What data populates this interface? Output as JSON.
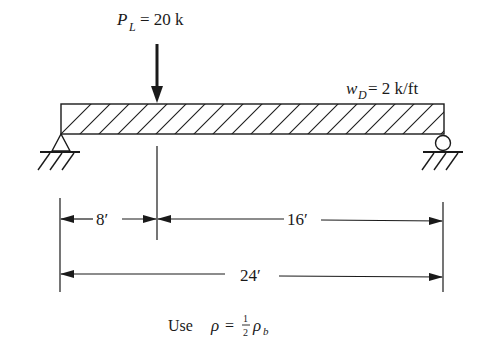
{
  "diagram": {
    "type": "simply-supported-beam",
    "point_load": {
      "symbol": "P",
      "subscript": "L",
      "value_text": "= 20 k",
      "position_ft": 8
    },
    "distributed_load": {
      "symbol": "w",
      "subscript": "D",
      "value_text": "= 2 k/ft"
    },
    "supports": {
      "left": "pin",
      "right": "roller"
    },
    "dimensions": {
      "segment_left": "8′",
      "segment_right": "16′",
      "total": "24′"
    },
    "note": {
      "prefix": "Use",
      "rho": "ρ",
      "equals": "=",
      "frac_num": "1",
      "frac_den": "2",
      "rho_b": "ρ",
      "rho_b_sub": "b"
    },
    "colors": {
      "ink": "#1a1a1a",
      "background": "#ffffff"
    }
  }
}
